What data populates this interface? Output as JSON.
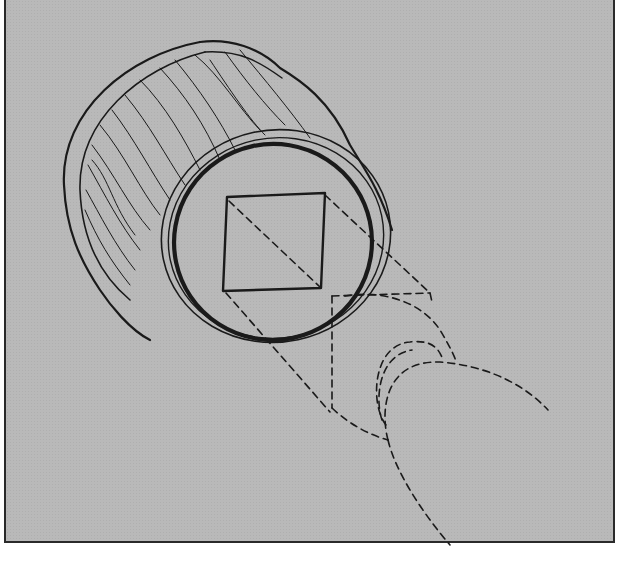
{
  "figure": {
    "colors": {
      "background": "#b9b9b9",
      "ink": "#1a1a1a",
      "page": "#ffffff"
    },
    "elements": [
      {
        "name": "wooden-cylinder",
        "style": "solid",
        "note": "wood-grain body"
      },
      {
        "name": "front-face-rings",
        "style": "solid",
        "note": "two thin rings and one thick ring"
      },
      {
        "name": "square-cross-section",
        "style": "solid"
      },
      {
        "name": "diagonal-construction-line",
        "style": "dashed"
      },
      {
        "name": "projection-lines",
        "style": "dashed"
      },
      {
        "name": "projected-shape",
        "style": "dashed",
        "note": "circle and cylinder outline projected from square"
      }
    ]
  }
}
